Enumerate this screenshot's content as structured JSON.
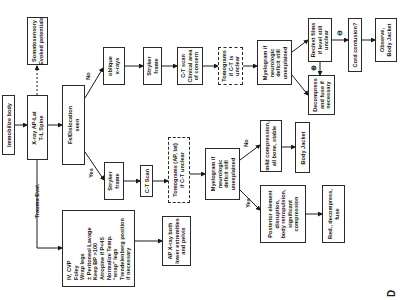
{
  "diagram": {
    "figure_label": "D",
    "nodes": {
      "immobilize": "Immobilize body",
      "xray": "X-ray AP-Lat\nT-L Spine",
      "ssep": "Somatosensory\nEvoked potentials",
      "fx_seen": "Fx/Dislocation\nseen",
      "oblique": "oblique\nx-rays",
      "stryker_top": "Stryker\nframe",
      "ct_top": "C-T scan\nClinical area\nof concern",
      "tomo_top": "Tomograms\nif C-T is\nunclear",
      "myelo_top": "Myelogram if\nneurologic\ndeficit still\nunexplained",
      "recext": "Rec/ext films\nif level still\nunclear",
      "decompress_fuse": "Decompress\nand fuse if\nnecessary",
      "cord": "Cord contusion?",
      "observe": "Observe,\nBody Jacket",
      "stryker_bottom": "Stryker\nframe",
      "ct_bottom": "C-T Scan",
      "tomo_bottom": "Tomograms (AP, lat)\nif C-T unclear",
      "myelo_bottom": "Myelogram if\nneurologic\ndeficit still\nunexplained",
      "mild": "mild compression,\nall bone, stable",
      "body_jacket": "Body Jacket",
      "posterior": "Posterior element\ndisruption,\nbody retropulsion,\nsignificant\ncompression",
      "red_decompress": "Red., decompress,\nfuse",
      "trauma_box": "IV, CVP\nFoley\nWrap legs\n± Peritoneal Lavage\nKeep BP >100\nAtropine if P<45\nNormalize Temp.\n“wrap” legs\nTrendelenberg position\nif necessary",
      "ap_xray": "AP X-ray both\nlower extremities\nand pelvis"
    },
    "edge_labels": {
      "no_top": "No",
      "yes_bottom": "Yes",
      "trauma_eval": "Trauma Eval.",
      "no_mid": "No",
      "yes_mid": "Yes",
      "minus": "⊖",
      "plus": "⊕"
    }
  }
}
